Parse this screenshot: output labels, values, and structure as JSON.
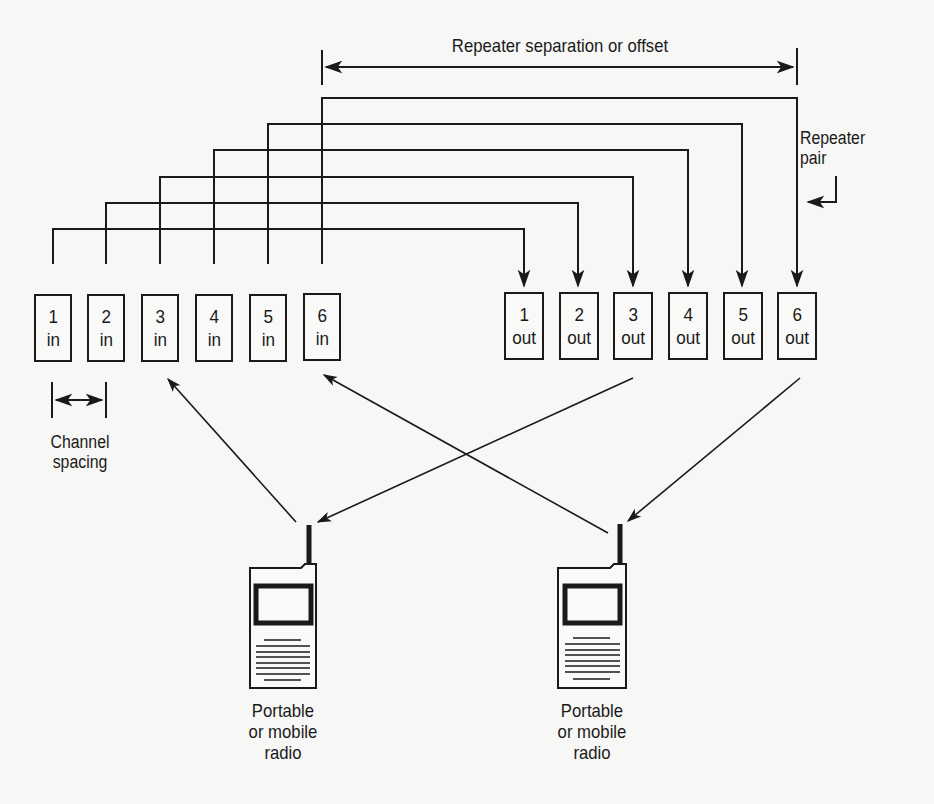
{
  "diagram": {
    "type": "repeater-channel-pairing",
    "offset_label": "Repeater separation or offset",
    "pair_label_line1": "Repeater",
    "pair_label_line2": "pair",
    "spacing_label_line1": "Channel",
    "spacing_label_line2": "spacing",
    "inputs": [
      {
        "num": "1",
        "dir": "in"
      },
      {
        "num": "2",
        "dir": "in"
      },
      {
        "num": "3",
        "dir": "in"
      },
      {
        "num": "4",
        "dir": "in"
      },
      {
        "num": "5",
        "dir": "in"
      },
      {
        "num": "6",
        "dir": "in"
      }
    ],
    "outputs": [
      {
        "num": "1",
        "dir": "out"
      },
      {
        "num": "2",
        "dir": "out"
      },
      {
        "num": "3",
        "dir": "out"
      },
      {
        "num": "4",
        "dir": "out"
      },
      {
        "num": "5",
        "dir": "out"
      },
      {
        "num": "6",
        "dir": "out"
      }
    ],
    "radios": [
      {
        "line1": "Portable",
        "line2": "or mobile",
        "line3": "radio"
      },
      {
        "line1": "Portable",
        "line2": "or mobile",
        "line3": "radio"
      }
    ],
    "links": [
      {
        "from": "radio-left",
        "to": "3 in"
      },
      {
        "from": "3 out",
        "to": "radio-left"
      },
      {
        "from": "radio-right",
        "to": "6 in"
      },
      {
        "from": "6 out",
        "to": "radio-right"
      }
    ]
  }
}
